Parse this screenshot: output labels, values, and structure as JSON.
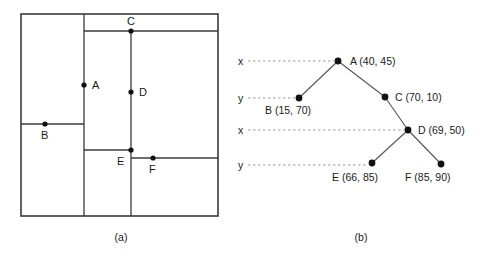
{
  "figure": {
    "caption_a": "(a)",
    "caption_b": "(b)"
  },
  "partition_diagram": {
    "name": "space-partition-rectangle",
    "bounds": {
      "x0": 21,
      "y0": 14,
      "x1": 218,
      "y1": 216
    },
    "points": [
      {
        "id": "A",
        "label": "A",
        "px": 84,
        "py": 85,
        "lx": 92,
        "ly": 89
      },
      {
        "id": "B",
        "label": "B",
        "px": 45,
        "py": 124,
        "lx": 41,
        "ly": 139
      },
      {
        "id": "C",
        "label": "C",
        "px": 131,
        "py": 31,
        "lx": 127,
        "ly": 25
      },
      {
        "id": "D",
        "label": "D",
        "px": 131,
        "py": 92,
        "lx": 139,
        "ly": 96
      },
      {
        "id": "E",
        "label": "E",
        "px": 131,
        "py": 150,
        "lx": 117,
        "ly": 165
      },
      {
        "id": "F",
        "label": "F",
        "px": 153,
        "py": 158,
        "lx": 149,
        "ly": 173
      }
    ],
    "cuts": [
      {
        "id": "A",
        "orientation": "vertical",
        "at": 84,
        "from": 14,
        "to": 216
      },
      {
        "id": "C",
        "orientation": "horizontal",
        "at": 31,
        "from": 84,
        "to": 218
      },
      {
        "id": "B",
        "orientation": "horizontal",
        "at": 124,
        "from": 21,
        "to": 84
      },
      {
        "id": "D",
        "orientation": "vertical",
        "at": 131,
        "from": 31,
        "to": 216
      },
      {
        "id": "E",
        "orientation": "horizontal",
        "at": 150,
        "from": 84,
        "to": 131
      },
      {
        "id": "F",
        "orientation": "horizontal",
        "at": 158,
        "from": 131,
        "to": 218
      }
    ]
  },
  "tree_diagram": {
    "name": "kd-tree",
    "axis_labels": [
      {
        "text": "x",
        "x": 238,
        "y": 65,
        "guide_from": 248,
        "guide_to": 334,
        "guide_y": 61
      },
      {
        "text": "y",
        "x": 238,
        "y": 102,
        "guide_from": 248,
        "guide_to": 295,
        "guide_y": 98
      },
      {
        "text": "x",
        "x": 238,
        "y": 134,
        "guide_from": 248,
        "guide_to": 404,
        "guide_y": 130
      },
      {
        "text": "y",
        "x": 238,
        "y": 169,
        "guide_from": 248,
        "guide_to": 368,
        "guide_y": 165
      }
    ],
    "nodes": [
      {
        "id": "A",
        "label": "A (40, 45)",
        "px": 338,
        "py": 61,
        "lx": 350,
        "ly": 65
      },
      {
        "id": "B",
        "label": "B (15, 70)",
        "px": 299,
        "py": 98,
        "lx": 265,
        "ly": 114
      },
      {
        "id": "C",
        "label": "C (70, 10)",
        "px": 385,
        "py": 97,
        "lx": 395,
        "ly": 101
      },
      {
        "id": "D",
        "label": "D (69, 50)",
        "px": 408,
        "py": 130,
        "lx": 418,
        "ly": 134
      },
      {
        "id": "E",
        "label": "E (66, 85)",
        "px": 372,
        "py": 163,
        "lx": 332,
        "ly": 181
      },
      {
        "id": "F",
        "label": "F (85, 90)",
        "px": 441,
        "py": 164,
        "lx": 405,
        "ly": 181
      }
    ],
    "edges": [
      {
        "from": "A",
        "to": "B"
      },
      {
        "from": "A",
        "to": "C"
      },
      {
        "from": "C",
        "to": "D"
      },
      {
        "from": "D",
        "to": "E"
      },
      {
        "from": "D",
        "to": "F"
      }
    ]
  },
  "colors": {
    "line": "#3a3a3a",
    "tree_edge": "#555555",
    "guide": "#9a9a9a",
    "dot": "#111111",
    "text": "#1a1a1a",
    "background": "#ffffff"
  }
}
